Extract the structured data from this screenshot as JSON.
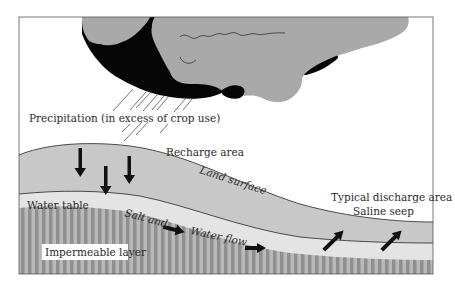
{
  "labels": {
    "precipitation": "Precipitation (in excess of crop use)",
    "recharge_area": "Recharge area",
    "land_surface": "Land surface",
    "discharge_area": "Typical discharge area",
    "saline_seep": "Saline seep",
    "water_table": "Water table",
    "salt_and": "Salt and",
    "water_flow": "Water flow",
    "impermeable_layer": "Impermeable layer"
  },
  "colors": {
    "cloud_light": "#a9a9a9",
    "cloud_dark": "#050505",
    "soil_unsaturated": "#c8c8c8",
    "saturated_zone": "#e4e4e4",
    "impermeable_stripe_dark": "#8f8f8f",
    "impermeable_stripe_light": "#b9b9b9",
    "arrow": "#111111",
    "frame": "#555555"
  }
}
